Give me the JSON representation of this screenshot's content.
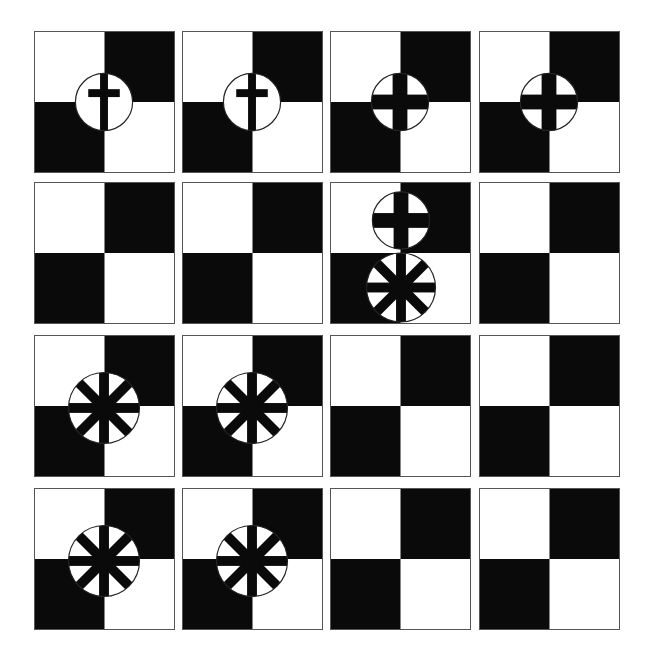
{
  "colors": {
    "dark": "#0a0a0a",
    "light": "#ffffff",
    "border": "#555555",
    "circle_stroke": "#222222"
  },
  "grid": {
    "columns_x": [
      34,
      182,
      330,
      479
    ],
    "rows_y": [
      31,
      182,
      335,
      488
    ],
    "tile_w": 141,
    "tile_h": 142
  },
  "tiles": [
    {
      "row": 0,
      "col": 0,
      "emblems": [
        {
          "type": "latin-cross",
          "cx": 70,
          "cy": 71,
          "r": 29
        }
      ]
    },
    {
      "row": 0,
      "col": 1,
      "emblems": [
        {
          "type": "latin-cross",
          "cx": 70,
          "cy": 71,
          "r": 29
        }
      ]
    },
    {
      "row": 0,
      "col": 2,
      "emblems": [
        {
          "type": "greek-cross",
          "cx": 70,
          "cy": 71,
          "r": 29
        }
      ]
    },
    {
      "row": 0,
      "col": 3,
      "emblems": [
        {
          "type": "greek-cross",
          "cx": 70,
          "cy": 71,
          "r": 29
        }
      ]
    },
    {
      "row": 1,
      "col": 0,
      "emblems": []
    },
    {
      "row": 1,
      "col": 1,
      "emblems": []
    },
    {
      "row": 1,
      "col": 2,
      "emblems": [
        {
          "type": "greek-cross",
          "cx": 71,
          "cy": 38,
          "r": 29
        },
        {
          "type": "wheel",
          "cx": 71,
          "cy": 106,
          "r": 35
        }
      ]
    },
    {
      "row": 1,
      "col": 3,
      "emblems": []
    },
    {
      "row": 2,
      "col": 0,
      "emblems": [
        {
          "type": "wheel",
          "cx": 70,
          "cy": 73,
          "r": 36
        }
      ]
    },
    {
      "row": 2,
      "col": 1,
      "emblems": [
        {
          "type": "wheel",
          "cx": 70,
          "cy": 73,
          "r": 36
        }
      ]
    },
    {
      "row": 2,
      "col": 2,
      "emblems": []
    },
    {
      "row": 2,
      "col": 3,
      "emblems": []
    },
    {
      "row": 3,
      "col": 0,
      "emblems": [
        {
          "type": "wheel",
          "cx": 70,
          "cy": 73,
          "r": 36
        }
      ]
    },
    {
      "row": 3,
      "col": 1,
      "emblems": [
        {
          "type": "wheel",
          "cx": 70,
          "cy": 73,
          "r": 36
        }
      ]
    },
    {
      "row": 3,
      "col": 2,
      "emblems": []
    },
    {
      "row": 3,
      "col": 3,
      "emblems": []
    }
  ]
}
